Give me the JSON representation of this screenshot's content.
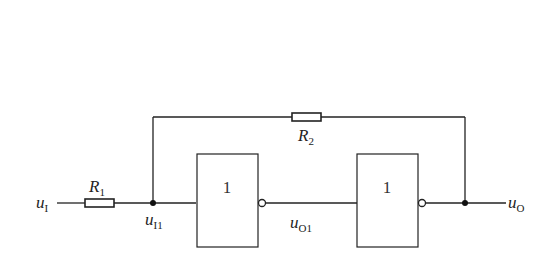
{
  "diagram": {
    "type": "circuit",
    "labels": {
      "input": {
        "main": "u",
        "sub": "I"
      },
      "r1": {
        "main": "R",
        "sub": "1"
      },
      "r2": {
        "main": "R",
        "sub": "2"
      },
      "node_i1": {
        "main": "u",
        "sub": "I1"
      },
      "node_o1": {
        "main": "u",
        "sub": "O1"
      },
      "output": {
        "main": "u",
        "sub": "O"
      }
    },
    "gates": [
      {
        "name": "inverter-1",
        "symbol": "1"
      },
      {
        "name": "inverter-2",
        "symbol": "1"
      }
    ]
  }
}
